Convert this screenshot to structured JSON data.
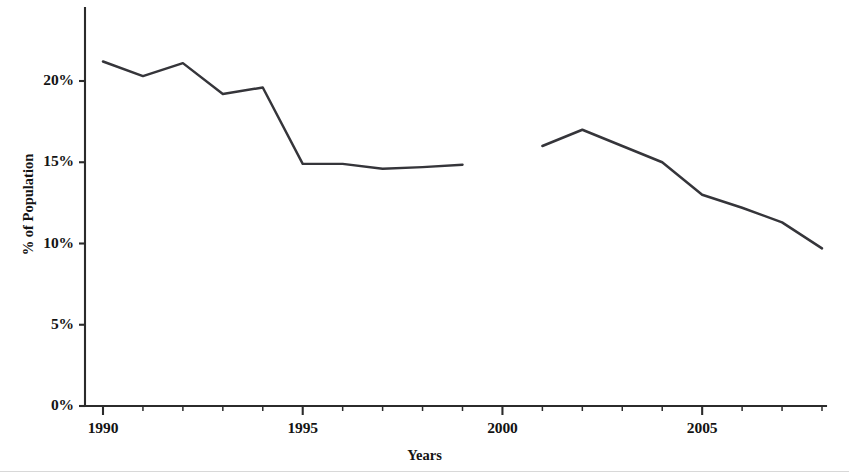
{
  "chart_data": {
    "type": "line",
    "title": "",
    "xlabel": "Years",
    "ylabel": "% of Population",
    "xlim": [
      1989.55,
      1990.0
    ],
    "ylim": [
      0,
      24.6
    ],
    "grid": false,
    "legend": "none",
    "y_ticks": [
      "0%",
      "5%",
      "10%",
      "15%",
      "20%"
    ],
    "y_tick_values": [
      0,
      5,
      10,
      15,
      20
    ],
    "x_ticks": [
      "1990",
      "1995",
      "2000",
      "2005"
    ],
    "x_tick_values": [
      1990,
      1995,
      2000,
      2005
    ],
    "x_minor_tick_values": [
      1991,
      1992,
      1993,
      1994,
      1996,
      1997,
      1998,
      1999,
      2001,
      2002,
      2003,
      2004,
      2006,
      2007,
      2008
    ],
    "x_axis_range": [
      1990,
      2008
    ],
    "series": [
      {
        "name": "Segment 1",
        "x": [
          1990,
          1991,
          1992,
          1993,
          1994,
          1995,
          1996,
          1997,
          1998,
          1999
        ],
        "values": [
          21.2,
          20.3,
          21.1,
          19.2,
          19.6,
          14.9,
          14.9,
          14.6,
          14.7,
          14.85
        ]
      },
      {
        "name": "Segment 2",
        "x": [
          2001,
          2002,
          2003,
          2004,
          2005,
          2006,
          2007,
          2008
        ],
        "values": [
          16.0,
          17.0,
          16.0,
          15.0,
          13.0,
          12.2,
          11.3,
          9.7
        ]
      }
    ],
    "line_color": "#35353a",
    "axis_color": "#2b2b2b",
    "background_color": "#ffffff"
  },
  "axis": {
    "y_label_text": "% of Population",
    "x_label_text": "Years"
  }
}
